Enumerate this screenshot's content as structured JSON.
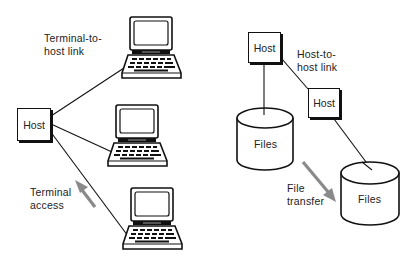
{
  "diagram": {
    "left": {
      "host": {
        "label": "Host"
      },
      "link_label_line1": "Terminal-to-",
      "link_label_line2": "host link",
      "access_label_line1": "Terminal",
      "access_label_line2": "access",
      "terminals": [
        {
          "name": "terminal-1"
        },
        {
          "name": "terminal-2"
        },
        {
          "name": "terminal-3"
        }
      ]
    },
    "right": {
      "host_a": {
        "label": "Host"
      },
      "host_b": {
        "label": "Host"
      },
      "link_label_line1": "Host-to-",
      "link_label_line2": "host link",
      "files_a": {
        "label": "Files"
      },
      "files_b": {
        "label": "Files"
      },
      "transfer_label_line1": "File",
      "transfer_label_line2": "transfer"
    },
    "colors": {
      "line": "#111111",
      "arrow": "#8a8a8a",
      "background": "#ffffff"
    }
  }
}
